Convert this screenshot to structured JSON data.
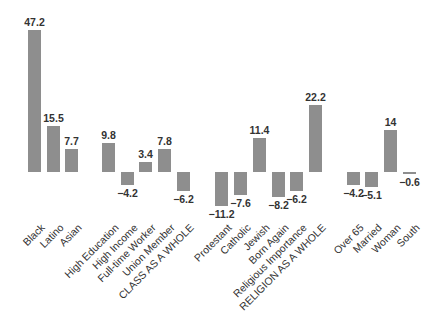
{
  "chart_data": {
    "type": "bar",
    "title": "",
    "xlabel": "",
    "ylabel": "",
    "ylim": [
      -15,
      50
    ],
    "grid": false,
    "legend": null,
    "categories": [
      "Black",
      "Latino",
      "Asian",
      "High Education",
      "High Income",
      "Full-time Worker",
      "Union Member",
      "CLASS AS A WHOLE",
      "Protestant",
      "Catholic",
      "Jewish",
      "Born Again",
      "Religious Importance",
      "RELIGION AS A WHOLE",
      "Over 65",
      "Married",
      "Woman",
      "South"
    ],
    "values": [
      47.2,
      15.5,
      7.7,
      9.8,
      -4.2,
      3.4,
      7.8,
      -6.2,
      -11.2,
      -7.6,
      11.4,
      -8.2,
      -6.2,
      22.2,
      -4.2,
      -5.1,
      14,
      -0.6
    ],
    "value_labels": [
      "47.2",
      "15.5",
      "7.7",
      "9.8",
      "−4.2",
      "3.4",
      "7.8",
      "−6.2",
      "−11.2",
      "−7.6",
      "11.4",
      "−8.2",
      "−6.2",
      "22.2",
      "−4.2",
      "−5.1",
      "14",
      "−0.6"
    ],
    "groups": [
      {
        "name": "race",
        "members": [
          "Black",
          "Latino",
          "Asian"
        ]
      },
      {
        "name": "class",
        "members": [
          "High Education",
          "High Income",
          "Full-time Worker",
          "Union Member",
          "CLASS AS A WHOLE"
        ]
      },
      {
        "name": "religion",
        "members": [
          "Protestant",
          "Catholic",
          "Jewish",
          "Born Again",
          "Religious Importance",
          "RELIGION AS A WHOLE"
        ]
      },
      {
        "name": "other",
        "members": [
          "Over 65",
          "Married",
          "Woman",
          "South"
        ]
      }
    ],
    "bar_color": "#8e8e8e"
  },
  "layout": {
    "baseline_y": 172,
    "px_per_unit": 3,
    "bar_width": 13,
    "bar_x": [
      28,
      47,
      65,
      102,
      121,
      139,
      158,
      177,
      215,
      234,
      253,
      272,
      290,
      309,
      347,
      365,
      384,
      403
    ]
  }
}
